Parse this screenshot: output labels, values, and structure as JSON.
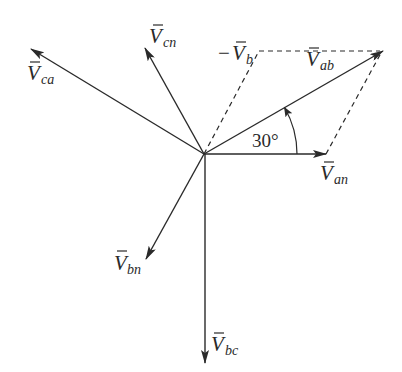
{
  "diagram": {
    "origin": [
      204,
      154
    ],
    "colors": {
      "stroke": "#2a2a2a",
      "background": "#ffffff"
    },
    "vectors": [
      {
        "id": "Van",
        "label_main": "V",
        "label_sub": "an",
        "tip": [
          326,
          154
        ],
        "angle_deg": 0
      },
      {
        "id": "Vab",
        "label_main": "V",
        "label_sub": "ab",
        "tip": [
          383,
          51
        ],
        "angle_deg": 30
      },
      {
        "id": "Vcn",
        "label_main": "V",
        "label_sub": "cn",
        "tip": [
          145,
          48
        ],
        "angle_deg": 120
      },
      {
        "id": "Vca",
        "label_main": "V",
        "label_sub": "ca",
        "tip": [
          31,
          49
        ],
        "angle_deg": 150
      },
      {
        "id": "Vbn",
        "label_main": "V",
        "label_sub": "bn",
        "tip": [
          146,
          259
        ],
        "angle_deg": 240
      },
      {
        "id": "Vbc",
        "label_main": "V",
        "label_sub": "bc",
        "tip": [
          205,
          363
        ],
        "angle_deg": 270
      }
    ],
    "dashed_construction": {
      "minus_vb": {
        "label_prefix": "−",
        "label_main": "V",
        "label_sub": "b",
        "from": [
          204,
          154
        ],
        "to": [
          259,
          51
        ]
      },
      "top_edge": {
        "from": [
          259,
          51
        ],
        "to": [
          383,
          51
        ]
      },
      "right_edge": {
        "from": [
          326,
          154
        ],
        "to": [
          383,
          51
        ]
      }
    },
    "angle_annotation": {
      "text": "30°",
      "radius": 93,
      "from_deg": 0,
      "to_deg": 30
    }
  }
}
